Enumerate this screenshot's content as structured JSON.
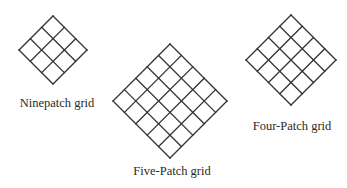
{
  "diagram": {
    "line_color": "#333333",
    "grids": [
      {
        "id": "ninepatch",
        "label": "Ninepatch grid",
        "divisions": 3,
        "cx": 53,
        "cy": 50,
        "half": 34,
        "label_x": 57,
        "label_y": 97
      },
      {
        "id": "five-patch",
        "label": "Five-Patch grid",
        "divisions": 5,
        "cx": 170,
        "cy": 101,
        "half": 57,
        "label_x": 172,
        "label_y": 165
      },
      {
        "id": "four-patch",
        "label": "Four-Patch grid",
        "divisions": 4,
        "cx": 291,
        "cy": 60,
        "half": 45,
        "label_x": 292,
        "label_y": 120
      }
    ]
  }
}
